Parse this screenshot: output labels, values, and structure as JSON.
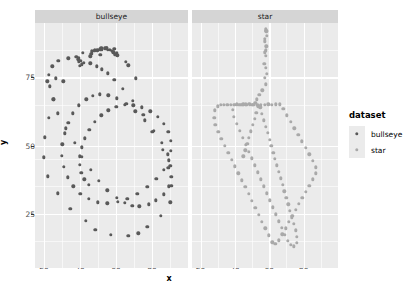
{
  "chart_data": {
    "type": "scatter",
    "title": "",
    "xlabel": "x",
    "ylabel": "y",
    "facet_by": "dataset",
    "facets": [
      "bullseye",
      "star"
    ],
    "xlim": [
      15,
      100
    ],
    "ylim": [
      5,
      95
    ],
    "x_ticks": [
      20,
      40,
      60,
      80
    ],
    "y_ticks": [
      25,
      50,
      75
    ],
    "x_minor_ticks": [
      30,
      50,
      70,
      90
    ],
    "y_minor_ticks": [
      15,
      35,
      45,
      65,
      85
    ],
    "grid": true,
    "legend_position": "right",
    "legend_title": "dataset",
    "colors": {
      "bullseye": "#595959",
      "star": "#a9a9a9",
      "panel_bg": "#ebebeb",
      "strip_bg": "#d5d5d5",
      "gridline": "#ffffff",
      "text": "#000000",
      "tick_text": "#4d4d4d"
    },
    "series": [
      {
        "name": "bullseye",
        "color": "#595959",
        "x": [
          51.2,
          58.97,
          51.87,
          48.18,
          41.68,
          37.89,
          39.49,
          56.71,
          49.68,
          58.6,
          39.42,
          40.38,
          42.01,
          54.96,
          26.56,
          21.77,
          41.01,
          53.89,
          54.0,
          60.57,
          51.34,
          46.5,
          45.65,
          46.18,
          52.21,
          55.5,
          57.5,
          58.86,
          60.65,
          47.99,
          59.26,
          65.38,
          66.77,
          70.85,
          54.71,
          40.05,
          30.78,
          25.58,
          22.64,
          20.48,
          20.02,
          22.09,
          27.51,
          34.53,
          43.29,
          48.57,
          57.03,
          66.74,
          72.39,
          77.44,
          84.75,
          90.25,
          90.62,
          89.0,
          86.0,
          80.21,
          75.12,
          69.48,
          63.67,
          58.97,
          55.42,
          52.27,
          49.49,
          45.76,
          39.15,
          33.41,
          28.04,
          24.52,
          22.79,
          23.22,
          25.08,
          27.81,
          32.21,
          36.98,
          41.09,
          45.87,
          50.47,
          55.09,
          60.31,
          65.05,
          69.12,
          72.96,
          78.11,
          82.1,
          86.44,
          89.46,
          90.78,
          90.09,
          88.62,
          85.53,
          81.1,
          75.92,
          70.78,
          65.69,
          60.51,
          55.82,
          51.12,
          47.14,
          43.41,
          39.47,
          36.04,
          33.43,
          31.4,
          30.07,
          29.96,
          31.11,
          33.2,
          36.19,
          40.13,
          44.79,
          49.91,
          55.23,
          60.88,
          66.33,
          71.79,
          77.34,
          82.48,
          86.68,
          89.48,
          90.56,
          90.31,
          88.97,
          86.56,
          83.19,
          79.06,
          74.46,
          69.66,
          64.92,
          60.19,
          55.82,
          51.86,
          48.25,
          45.24,
          42.76,
          41.02,
          40.05,
          40.0,
          40.82,
          42.44,
          44.86
        ],
        "y": [
          83.34,
          85.5,
          85.83,
          85.05,
          84.02,
          82.57,
          80.74,
          85.12,
          84.96,
          84.22,
          82.29,
          81.16,
          80.39,
          85.87,
          74.62,
          73.62,
          79.87,
          85.9,
          85.55,
          84.12,
          85.32,
          84.59,
          82.72,
          83.66,
          85.37,
          85.23,
          84.88,
          84.19,
          83.12,
          84.83,
          83.44,
          80.66,
          79.5,
          74.72,
          85.93,
          79.37,
          73.52,
          66.97,
          60.22,
          53.02,
          45.71,
          38.74,
          32.37,
          26.84,
          22.36,
          19.13,
          17.23,
          16.79,
          17.81,
          20.21,
          24.08,
          29.18,
          35.22,
          41.76,
          48.53,
          55.13,
          61.18,
          66.47,
          70.87,
          74.21,
          76.5,
          78.02,
          79.14,
          80.26,
          81.64,
          82.05,
          81.22,
          79.07,
          75.86,
          71.68,
          66.94,
          61.78,
          56.35,
          50.94,
          45.81,
          41.12,
          37.02,
          33.56,
          30.87,
          28.98,
          27.91,
          27.69,
          28.36,
          29.83,
          32.11,
          35.07,
          38.57,
          42.54,
          46.78,
          51.1,
          55.32,
          59.22,
          62.6,
          65.34,
          67.33,
          68.5,
          68.85,
          68.3,
          66.93,
          64.74,
          61.86,
          58.41,
          54.53,
          50.41,
          46.21,
          42.12,
          38.33,
          35.02,
          32.33,
          30.36,
          29.18,
          28.82,
          29.26,
          30.46,
          32.36,
          34.85,
          37.81,
          41.1,
          44.6,
          48.14,
          51.62,
          54.92,
          57.91,
          60.48,
          62.52,
          63.97,
          64.76,
          64.86,
          64.26,
          62.99,
          61.1,
          58.68,
          55.83,
          52.68,
          49.39,
          46.09,
          42.92,
          40.02,
          37.52,
          35.53
        ]
      },
      {
        "name": "star",
        "color": "#a9a9a9",
        "x": [
          58.21,
          58.2,
          58.71,
          57.27,
          58.08,
          57.47,
          58.29,
          57.22,
          58.14,
          58.04,
          57.11,
          58.12,
          58.7,
          57.27,
          58.08,
          55.89,
          54.12,
          52.74,
          51.85,
          50.06,
          48.47,
          46.7,
          44.89,
          43.03,
          41.21,
          39.32,
          37.42,
          35.51,
          33.62,
          31.73,
          29.85,
          28.14,
          27.89,
          28.67,
          30.22,
          32.16,
          34.08,
          36.04,
          38.01,
          39.98,
          41.95,
          43.93,
          45.93,
          47.9,
          49.86,
          51.82,
          53.79,
          55.75,
          57.72,
          59.69,
          61.65,
          63.61,
          65.57,
          67.53,
          69.49,
          71.45,
          73.41,
          75.37,
          77.33,
          79.29,
          81.25,
          83.21,
          85.17,
          87.13,
          87.04,
          85.44,
          83.3,
          81.12,
          78.96,
          76.79,
          74.62,
          72.46,
          70.29,
          68.12,
          65.95,
          63.79,
          61.62,
          59.45,
          57.28,
          55.12,
          52.95,
          50.78,
          48.62,
          46.45,
          44.28,
          42.12,
          39.95,
          38.58,
          39.46,
          41.2,
          42.94,
          44.68,
          46.42,
          48.17,
          49.91,
          51.65,
          53.39,
          55.13,
          56.87,
          58.61,
          60.36,
          62.1,
          63.84,
          65.58,
          67.32,
          69.06,
          70.8,
          72.55,
          74.29,
          76.03,
          76.12,
          75.3,
          74.22,
          73.13,
          72.05,
          70.97,
          69.88,
          68.8,
          67.71,
          66.63,
          65.54,
          64.46,
          63.38,
          62.29,
          61.21,
          60.12,
          59.04,
          57.96,
          56.87,
          55.79,
          54.7,
          53.62,
          52.54,
          51.45,
          50.37,
          49.28,
          48.2,
          47.12,
          46.03,
          44.95
        ],
        "y": [
          91.88,
          92.21,
          90.31,
          89.12,
          92.74,
          88.23,
          86.46,
          84.29,
          83.04,
          85.01,
          80.1,
          78.63,
          76.27,
          74.85,
          72.42,
          70.24,
          68.55,
          67.02,
          65.78,
          64.99,
          65.21,
          64.87,
          65.2,
          64.98,
          65.11,
          64.91,
          65.02,
          64.88,
          64.96,
          65.04,
          64.42,
          62.87,
          60.12,
          57.51,
          54.96,
          52.4,
          49.88,
          47.35,
          44.82,
          42.3,
          39.77,
          37.24,
          34.72,
          32.19,
          29.66,
          27.14,
          24.61,
          22.08,
          19.56,
          17.03,
          14.51,
          13.9,
          15.2,
          17.4,
          19.64,
          21.87,
          24.11,
          26.34,
          28.58,
          30.81,
          33.05,
          35.28,
          37.52,
          39.75,
          42.01,
          44.32,
          46.7,
          49.1,
          51.5,
          53.9,
          56.3,
          58.7,
          61.1,
          63.5,
          65.15,
          65.08,
          64.93,
          65.12,
          64.87,
          65.06,
          64.92,
          65.03,
          64.88,
          65.1,
          64.95,
          65.02,
          64.9,
          63.12,
          60.58,
          58.02,
          55.46,
          52.9,
          50.35,
          47.79,
          45.23,
          42.68,
          40.12,
          37.56,
          35.0,
          32.45,
          29.89,
          27.33,
          24.78,
          22.22,
          19.66,
          17.11,
          14.9,
          13.52,
          12.9,
          14.2,
          16.48,
          18.86,
          21.24,
          23.62,
          26.0,
          28.38,
          30.76,
          33.14,
          35.52,
          37.9,
          40.28,
          42.66,
          45.04,
          47.42,
          49.8,
          52.18,
          54.56,
          56.94,
          59.32,
          61.7,
          64.08,
          64.4,
          62.1,
          59.8,
          57.5,
          55.2,
          52.9,
          50.6,
          48.3,
          46.0
        ]
      }
    ]
  },
  "legend": {
    "title": "dataset",
    "items": [
      {
        "label": "bullseye",
        "color": "#595959"
      },
      {
        "label": "star",
        "color": "#a9a9a9"
      }
    ]
  },
  "axes": {
    "x_title": "x",
    "y_title": "y",
    "x_tick_labels": [
      "20",
      "40",
      "60",
      "80"
    ],
    "y_tick_labels": [
      "25",
      "50",
      "75"
    ]
  },
  "facet_labels": [
    "bullseye",
    "star"
  ]
}
